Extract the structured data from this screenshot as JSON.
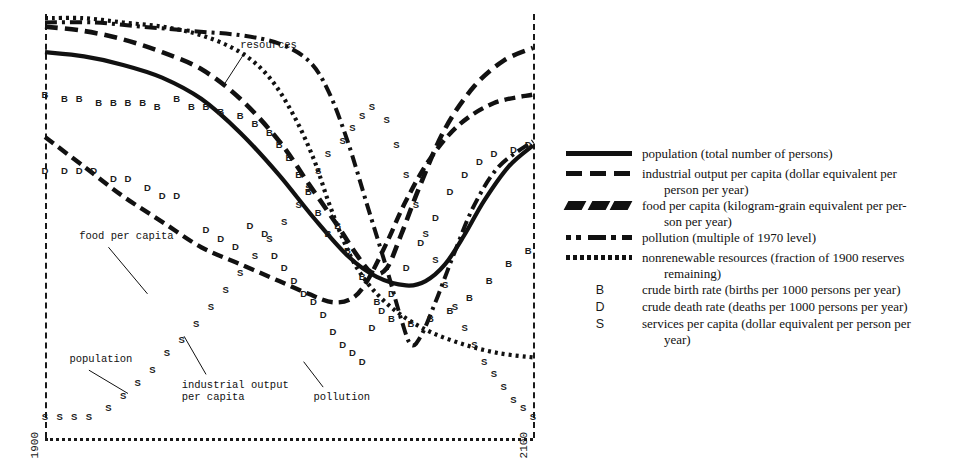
{
  "chart_data": {
    "type": "line",
    "title": "",
    "xlabel": "",
    "ylabel": "",
    "x_axis": {
      "start_label": "1900",
      "end_label": "2100",
      "grid": false
    },
    "annotations": [
      {
        "name": "resources",
        "label": "resources",
        "x_pct": 40,
        "y_pct": 6
      },
      {
        "name": "food-per-capita",
        "label": "food per capita",
        "x_pct": 7,
        "y_pct": 51
      },
      {
        "name": "population",
        "label": "population",
        "x_pct": 5,
        "y_pct": 80
      },
      {
        "name": "industrial-output-per-capita",
        "label": "industrial output\nper capita",
        "x_pct": 28,
        "y_pct": 86
      },
      {
        "name": "pollution",
        "label": "pollution",
        "x_pct": 55,
        "y_pct": 89
      }
    ],
    "series": [
      {
        "name": "population",
        "style": "solid",
        "points": [
          [
            0,
            9
          ],
          [
            8,
            10
          ],
          [
            16,
            12
          ],
          [
            24,
            15
          ],
          [
            32,
            20
          ],
          [
            40,
            28
          ],
          [
            48,
            38
          ],
          [
            55,
            48
          ],
          [
            62,
            57
          ],
          [
            68,
            62
          ],
          [
            74,
            64
          ],
          [
            78,
            63
          ],
          [
            82,
            59
          ],
          [
            86,
            52
          ],
          [
            90,
            44
          ],
          [
            95,
            36
          ],
          [
            100,
            31
          ]
        ]
      },
      {
        "name": "industrial output per capita",
        "style": "dashed",
        "points": [
          [
            0,
            3
          ],
          [
            8,
            4
          ],
          [
            16,
            6
          ],
          [
            24,
            9
          ],
          [
            32,
            13
          ],
          [
            40,
            20
          ],
          [
            48,
            30
          ],
          [
            54,
            40
          ],
          [
            60,
            50
          ],
          [
            64,
            57
          ],
          [
            67,
            61
          ],
          [
            70,
            60
          ],
          [
            73,
            52
          ],
          [
            77,
            40
          ],
          [
            82,
            27
          ],
          [
            88,
            17
          ],
          [
            94,
            11
          ],
          [
            100,
            8
          ]
        ]
      },
      {
        "name": "food per capita",
        "style": "slant-dashed",
        "points": [
          [
            0,
            29
          ],
          [
            8,
            36
          ],
          [
            16,
            43
          ],
          [
            24,
            49
          ],
          [
            32,
            55
          ],
          [
            40,
            59
          ],
          [
            48,
            63
          ],
          [
            54,
            66
          ],
          [
            59,
            68
          ],
          [
            63,
            67
          ],
          [
            66,
            63
          ],
          [
            70,
            54
          ],
          [
            74,
            44
          ],
          [
            79,
            34
          ],
          [
            85,
            26
          ],
          [
            92,
            21
          ],
          [
            100,
            19
          ]
        ]
      },
      {
        "name": "pollution",
        "style": "dash-dot",
        "points": [
          [
            0,
            2
          ],
          [
            10,
            2
          ],
          [
            20,
            3
          ],
          [
            30,
            4
          ],
          [
            40,
            5
          ],
          [
            48,
            7
          ],
          [
            54,
            11
          ],
          [
            58,
            18
          ],
          [
            62,
            30
          ],
          [
            66,
            45
          ],
          [
            70,
            60
          ],
          [
            73,
            72
          ],
          [
            75,
            78
          ],
          [
            77,
            76
          ],
          [
            80,
            68
          ],
          [
            84,
            56
          ],
          [
            88,
            45
          ],
          [
            93,
            36
          ],
          [
            100,
            30
          ]
        ]
      },
      {
        "name": "nonrenewable resources",
        "style": "dotted",
        "points": [
          [
            0,
            1
          ],
          [
            8,
            1
          ],
          [
            16,
            2
          ],
          [
            24,
            3
          ],
          [
            32,
            5
          ],
          [
            40,
            9
          ],
          [
            46,
            15
          ],
          [
            51,
            24
          ],
          [
            55,
            34
          ],
          [
            58,
            44
          ],
          [
            61,
            53
          ],
          [
            64,
            60
          ],
          [
            68,
            66
          ],
          [
            73,
            71
          ],
          [
            79,
            75
          ],
          [
            86,
            78
          ],
          [
            93,
            80
          ],
          [
            100,
            81
          ]
        ]
      }
    ],
    "markers": {
      "B": {
        "label": "crude birth rate",
        "points": [
          [
            0,
            19
          ],
          [
            4,
            20
          ],
          [
            7,
            20
          ],
          [
            11,
            21
          ],
          [
            14,
            21
          ],
          [
            17,
            21
          ],
          [
            20,
            21
          ],
          [
            23,
            22
          ],
          [
            27,
            20
          ],
          [
            30,
            22
          ],
          [
            33,
            22
          ],
          [
            36,
            23
          ],
          [
            40,
            24
          ],
          [
            43,
            26
          ],
          [
            46,
            28
          ],
          [
            48,
            31
          ],
          [
            50,
            34
          ],
          [
            52,
            38
          ],
          [
            54,
            42
          ],
          [
            56,
            47
          ],
          [
            58,
            52
          ],
          [
            60,
            50
          ],
          [
            62,
            56
          ],
          [
            65,
            62
          ],
          [
            68,
            68
          ],
          [
            71,
            72
          ],
          [
            75,
            73
          ],
          [
            79,
            72
          ],
          [
            83,
            70
          ],
          [
            87,
            67
          ],
          [
            91,
            63
          ],
          [
            95,
            59
          ],
          [
            99,
            56
          ]
        ]
      },
      "D": {
        "label": "crude death rate",
        "points": [
          [
            0,
            37
          ],
          [
            4,
            37
          ],
          [
            7,
            37
          ],
          [
            10,
            37
          ],
          [
            14,
            39
          ],
          [
            17,
            39
          ],
          [
            21,
            41
          ],
          [
            24,
            43
          ],
          [
            27,
            43
          ],
          [
            33,
            51
          ],
          [
            36,
            53
          ],
          [
            39,
            55
          ],
          [
            42,
            50
          ],
          [
            45,
            52
          ],
          [
            47,
            57
          ],
          [
            49,
            60
          ],
          [
            51,
            63
          ],
          [
            53,
            66
          ],
          [
            55,
            68
          ],
          [
            57,
            71
          ],
          [
            59,
            75
          ],
          [
            61,
            78
          ],
          [
            63,
            80
          ],
          [
            65,
            82
          ],
          [
            67,
            74
          ],
          [
            69,
            70
          ],
          [
            71,
            66
          ],
          [
            74,
            60
          ],
          [
            77,
            54
          ],
          [
            80,
            48
          ],
          [
            83,
            42
          ],
          [
            86,
            38
          ],
          [
            89,
            35
          ],
          [
            92,
            33
          ],
          [
            96,
            32
          ],
          [
            99,
            31
          ]
        ]
      },
      "S": {
        "label": "services per capita",
        "points": [
          [
            0,
            95
          ],
          [
            3,
            95
          ],
          [
            6,
            95
          ],
          [
            9,
            95
          ],
          [
            13,
            93
          ],
          [
            16,
            90
          ],
          [
            19,
            87
          ],
          [
            22,
            84
          ],
          [
            25,
            80
          ],
          [
            28,
            77
          ],
          [
            31,
            73
          ],
          [
            34,
            69
          ],
          [
            37,
            65
          ],
          [
            40,
            61
          ],
          [
            43,
            57
          ],
          [
            46,
            53
          ],
          [
            49,
            49
          ],
          [
            52,
            45
          ],
          [
            54,
            41
          ],
          [
            56,
            37
          ],
          [
            58,
            33
          ],
          [
            61,
            30
          ],
          [
            63,
            27
          ],
          [
            65,
            24
          ],
          [
            67,
            22
          ],
          [
            70,
            25
          ],
          [
            72,
            31
          ],
          [
            74,
            38
          ],
          [
            76,
            45
          ],
          [
            78,
            52
          ],
          [
            80,
            58
          ],
          [
            82,
            64
          ],
          [
            84,
            69
          ],
          [
            86,
            74
          ],
          [
            88,
            78
          ],
          [
            90,
            82
          ],
          [
            92,
            85
          ],
          [
            94,
            88
          ],
          [
            96,
            91
          ],
          [
            98,
            93
          ],
          [
            100,
            95
          ]
        ]
      }
    }
  },
  "legend": {
    "items": [
      {
        "key": "solid-line-swatch",
        "name": "population",
        "text": "population (total number of persons)",
        "cont": ""
      },
      {
        "key": "dashed-line-swatch",
        "name": "industrial-output",
        "text": "industrial output per capita (dollar equivalent per",
        "cont": "person per year)"
      },
      {
        "key": "slant-dash-swatch",
        "name": "food-per-capita",
        "text": "food per capita (kilogram-grain equivalent per per-",
        "cont": "son per year)"
      },
      {
        "key": "dash-dot-swatch",
        "name": "pollution",
        "text": "pollution (multiple of 1970 level)",
        "cont": ""
      },
      {
        "key": "dotted-line-swatch",
        "name": "nonrenewable-resources",
        "text": "nonrenewable resources (fraction of 1900 reserves",
        "cont": "remaining)"
      },
      {
        "key": "B",
        "name": "crude-birth-rate",
        "text": "crude birth rate (births per 1000 persons per year)",
        "cont": ""
      },
      {
        "key": "D",
        "name": "crude-death-rate",
        "text": "crude death rate (deaths per 1000 persons per year)",
        "cont": ""
      },
      {
        "key": "S",
        "name": "services-per-capita",
        "text": "services per capita (dollar equivalent per person per",
        "cont": "year)"
      }
    ]
  },
  "colors": {
    "ink": "#111111",
    "background": "#ffffff"
  }
}
